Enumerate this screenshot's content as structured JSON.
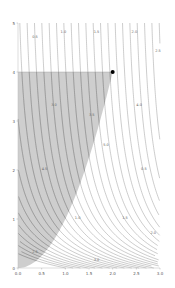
{
  "chart_data": {
    "type": "contour",
    "title": "",
    "xlabel": "",
    "ylabel": "",
    "xlim": [
      0,
      3
    ],
    "ylim": [
      0,
      5
    ],
    "x_ticks": [
      "0.0",
      "0.5",
      "1.0",
      "1.5",
      "2.0",
      "2.5",
      "3.0"
    ],
    "y_ticks": [
      "0",
      "1",
      "2",
      "3",
      "4",
      "5"
    ],
    "x_tick_values": [
      0,
      0.5,
      1.0,
      1.5,
      2.0,
      2.5,
      3.0
    ],
    "y_tick_values": [
      0,
      1,
      2,
      3,
      4,
      5
    ],
    "grid": false,
    "shaded_region": {
      "description": "x^2 <= y <= 4, x >= 0",
      "upper_bound_y": 4,
      "lower_curve": "y = x^2",
      "x_range": [
        0,
        2
      ],
      "fill_color": "#bdbdbd"
    },
    "highlight_point": {
      "x": 2.0,
      "y": 4.0,
      "color": "#000000"
    },
    "contour_levels_count": 30,
    "contour_color": "#9a9a9a",
    "contour_labels": [
      "0.5",
      "1.0",
      "1.5",
      "2.0",
      "2.5",
      "3.0",
      "3.5",
      "4.0",
      "4.5",
      "5.0"
    ]
  }
}
